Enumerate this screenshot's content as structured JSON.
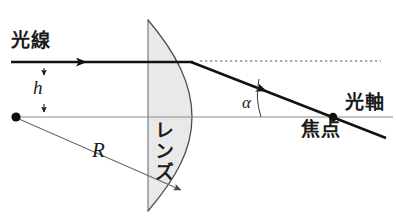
{
  "figure": {
    "background_color": "#ffffff",
    "width": 396,
    "height": 221
  },
  "labels": {
    "incident_ray": "光線",
    "optical_axis": "光軸",
    "focal_point": "焦点",
    "lens": "レンズ",
    "ray_height": "h",
    "radius": "R",
    "refraction_angle": "α"
  },
  "colors": {
    "ink": "#1a1a1a",
    "lens_fill": "#e9e9e9",
    "lens_stroke": "#6d6d6d",
    "thin_line": "#8a8a8a",
    "ray": "#121212",
    "dotted": "#555555"
  },
  "geometry": {
    "optical_axis_y": 117,
    "incident_ray_y": 62,
    "center_dot_x": 16,
    "center_dot_y": 117,
    "focal_point_x": 333,
    "focal_point_y": 117,
    "lens_flat_edge_x": 148,
    "lens_vertex_x": 192,
    "lens_top_y": 20,
    "lens_bottom_y": 211,
    "radius_arrow_end_x": 183,
    "radius_arrow_end_y": 192,
    "dotted_line_start_x": 200,
    "dotted_line_end_x": 381
  }
}
